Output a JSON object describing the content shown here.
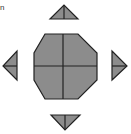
{
  "diagram": {
    "type": "octagon-net",
    "colors": {
      "fill": "#8c8c8c",
      "stroke": "#222222",
      "background": "#ffffff"
    },
    "center_shape": {
      "name": "octagon",
      "divisions": 4
    },
    "flaps": [
      {
        "position": "top",
        "shape": "triangle",
        "direction": "up"
      },
      {
        "position": "right",
        "shape": "triangle",
        "direction": "right"
      },
      {
        "position": "bottom",
        "shape": "triangle",
        "direction": "down"
      },
      {
        "position": "left",
        "shape": "triangle",
        "direction": "left"
      }
    ],
    "corner_mark": "n"
  }
}
